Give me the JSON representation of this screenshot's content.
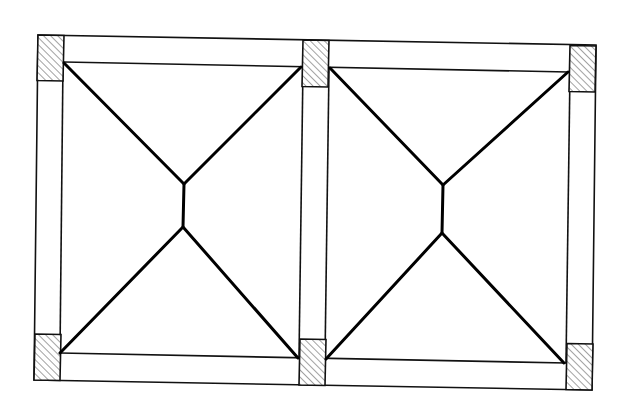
{
  "diagram": {
    "title": "Two-bay slab plan with corner columns and yield-line pattern",
    "colors": {
      "line": "#000000",
      "hatch": "#555555",
      "background": "#ffffff"
    },
    "outer_frame": [
      [
        38,
        35
      ],
      [
        596,
        45
      ],
      [
        592,
        390
      ],
      [
        34,
        380
      ]
    ],
    "columns": [
      {
        "id": "col-top-left",
        "points": [
          [
            38,
            35
          ],
          [
            64,
            35.5
          ],
          [
            63,
            81
          ],
          [
            37,
            80.5
          ]
        ]
      },
      {
        "id": "col-top-middle",
        "points": [
          [
            303,
            40
          ],
          [
            329,
            40.5
          ],
          [
            328,
            87
          ],
          [
            302,
            86.5
          ]
        ]
      },
      {
        "id": "col-top-right",
        "points": [
          [
            570,
            45.5
          ],
          [
            596,
            46
          ],
          [
            595,
            92
          ],
          [
            569,
            91.5
          ]
        ]
      },
      {
        "id": "col-bottom-left",
        "points": [
          [
            35,
            334
          ],
          [
            61,
            334.5
          ],
          [
            60,
            380.5
          ],
          [
            34,
            380
          ]
        ]
      },
      {
        "id": "col-bottom-middle",
        "points": [
          [
            300,
            339
          ],
          [
            326,
            339.5
          ],
          [
            325,
            385.5
          ],
          [
            299,
            385
          ]
        ]
      },
      {
        "id": "col-bottom-right",
        "points": [
          [
            567,
            343.5
          ],
          [
            593,
            344
          ],
          [
            592,
            390
          ],
          [
            566,
            389.5
          ]
        ]
      }
    ],
    "beams": [
      {
        "id": "beam-top-inner",
        "from": [
          64,
          62
        ],
        "to": [
          568,
          72
        ]
      },
      {
        "id": "beam-bottom-inner",
        "from": [
          60,
          353
        ],
        "to": [
          566,
          363
        ]
      },
      {
        "id": "wall-left-inner",
        "from": [
          63,
          62
        ],
        "to": [
          60,
          353
        ]
      },
      {
        "id": "wall-mid-left",
        "from": [
          303,
          67
        ],
        "to": [
          299,
          358
        ]
      },
      {
        "id": "wall-mid-right",
        "from": [
          329,
          68
        ],
        "to": [
          325,
          359
        ]
      },
      {
        "id": "wall-right-inner",
        "from": [
          570,
          72
        ],
        "to": [
          566,
          363
        ]
      }
    ],
    "panels": [
      {
        "id": "panel-left",
        "ridge_top": [
          184,
          184
        ],
        "ridge_bottom": [
          183,
          227
        ],
        "corners": {
          "tl": [
            64,
            63
          ],
          "tr": [
            301,
            67
          ],
          "bl": [
            60,
            353
          ],
          "br": [
            298,
            358
          ]
        }
      },
      {
        "id": "panel-right",
        "ridge_top": [
          443,
          185
        ],
        "ridge_bottom": [
          442,
          233
        ],
        "corners": {
          "tl": [
            330,
            68
          ],
          "tr": [
            568,
            72
          ],
          "bl": [
            326,
            359
          ],
          "br": [
            564,
            363
          ]
        }
      }
    ]
  }
}
